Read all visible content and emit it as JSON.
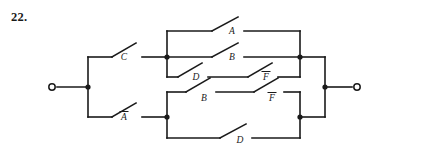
{
  "page": {
    "problem_number": "22.",
    "background_color": "#ffffff",
    "ink_color": "#1a1a1a"
  },
  "circuit": {
    "type": "switching-network",
    "terminals": [
      {
        "id": "left-terminal",
        "label": "",
        "x": 52,
        "y": 87
      },
      {
        "id": "right-terminal",
        "label": "",
        "x": 357,
        "y": 87
      }
    ],
    "switches": [
      {
        "id": "sw-c",
        "label": "C",
        "overbar": false,
        "row": "upper-input",
        "x": 124,
        "y": 57
      },
      {
        "id": "sw-a",
        "label": "A",
        "overbar": false,
        "row": "upper-row-1",
        "x": 232,
        "y": 31
      },
      {
        "id": "sw-b-upper",
        "label": "B",
        "overbar": false,
        "row": "upper-row-2",
        "x": 232,
        "y": 57
      },
      {
        "id": "sw-d-upper",
        "label": "D",
        "overbar": false,
        "row": "upper-row-3",
        "x": 196,
        "y": 77
      },
      {
        "id": "sw-fbar-upper",
        "label": "F",
        "overbar": true,
        "row": "upper-row-3",
        "x": 266,
        "y": 77
      },
      {
        "id": "sw-abar",
        "label": "A",
        "overbar": true,
        "row": "lower-input",
        "x": 124,
        "y": 117
      },
      {
        "id": "sw-b-lower",
        "label": "B",
        "overbar": false,
        "row": "lower-row-1",
        "x": 204,
        "y": 98
      },
      {
        "id": "sw-fbar-lower",
        "label": "F",
        "overbar": true,
        "row": "lower-row-1",
        "x": 272,
        "y": 98
      },
      {
        "id": "sw-d-lower",
        "label": "D",
        "overbar": false,
        "row": "lower-row-2",
        "x": 240,
        "y": 140
      }
    ],
    "junction_nodes": [
      {
        "id": "node-left-split",
        "x": 88,
        "y": 87
      },
      {
        "id": "node-upper-in",
        "x": 167,
        "y": 57
      },
      {
        "id": "node-lower-in",
        "x": 167,
        "y": 117
      },
      {
        "id": "node-upper-out",
        "x": 300,
        "y": 57
      },
      {
        "id": "node-lower-out",
        "x": 300,
        "y": 117
      },
      {
        "id": "node-right-collect",
        "x": 325,
        "y": 87
      }
    ]
  }
}
